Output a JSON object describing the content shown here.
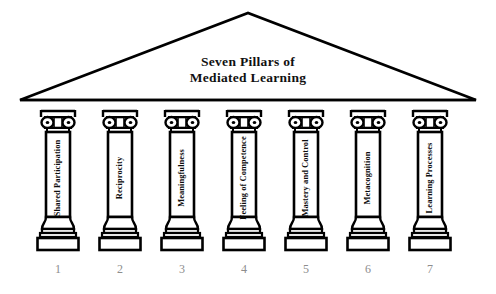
{
  "figure": {
    "title_lines": [
      "Seven Pillars of",
      "Mediated Learning"
    ],
    "title_full": "Seven Pillars of Mediated Learning",
    "background_color": "#ffffff",
    "ink_color": "#000000",
    "number_color": "#8d8d8d"
  },
  "pediment": {
    "name": "triangular-pediment",
    "apex_x": 248,
    "apex_y": 13,
    "left_x": 20,
    "right_x": 476,
    "base_y": 100
  },
  "pillars": [
    {
      "number": "1",
      "label": "Shared Participation",
      "x": 36
    },
    {
      "number": "2",
      "label": "Reciprocity",
      "x": 98
    },
    {
      "number": "3",
      "label": "Meaningfulness",
      "x": 160
    },
    {
      "number": "4",
      "label": "Feeling of Competence",
      "x": 222
    },
    {
      "number": "5",
      "label": "Mastery and Control",
      "x": 284
    },
    {
      "number": "6",
      "label": "Metacognition",
      "x": 346
    },
    {
      "number": "7",
      "label": "Learning Processes",
      "x": 408
    }
  ]
}
